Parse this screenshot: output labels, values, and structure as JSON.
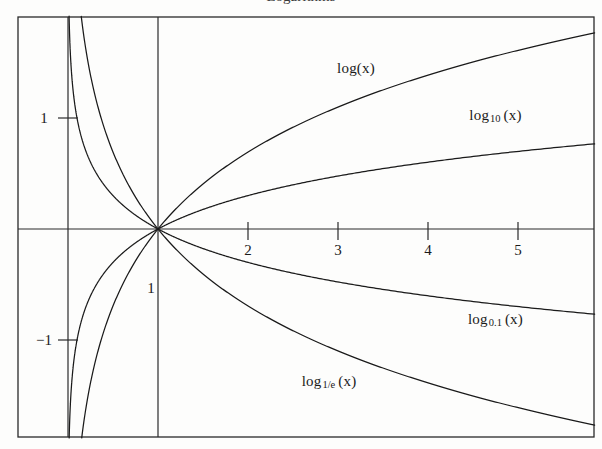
{
  "figure": {
    "width": 602,
    "height": 449,
    "background_color": "#fdfdfc",
    "ink_color": "#1a1a1a",
    "cropped_title_fragment": "Logarithms"
  },
  "chart_data": {
    "type": "line",
    "title": "",
    "xlabel": "",
    "ylabel": "",
    "xlim": [
      -0.57,
      5.97
    ],
    "ylim": [
      -1.87,
      1.91
    ],
    "grid": false,
    "legend_position": "inline-curve-labels",
    "x_ticks": [
      2,
      3,
      4,
      5
    ],
    "x_tick_labels": [
      "2",
      "3",
      "4",
      "5"
    ],
    "y_ticks": [
      1,
      -1
    ],
    "y_tick_labels": [
      "1",
      "-1"
    ],
    "axis_origin_label": "1",
    "series": [
      {
        "name": "log(x)",
        "label": "log(x)",
        "base": 2.718281828,
        "base_display": "",
        "label_x": 3.2,
        "label_y": 1.45,
        "color": "#1a1a1a",
        "x": [
          0.03,
          0.05,
          0.08,
          0.12,
          0.18,
          0.25,
          0.35,
          0.5,
          0.7,
          1.0,
          1.4,
          1.8,
          2.2,
          2.6,
          3.0,
          3.5,
          4.0,
          4.5,
          5.0,
          5.5,
          5.97
        ],
        "y": [
          -3.51,
          -3.0,
          -2.53,
          -2.12,
          -1.71,
          -1.39,
          -1.05,
          -0.69,
          -0.36,
          0.0,
          0.34,
          0.59,
          0.79,
          0.96,
          1.1,
          1.25,
          1.39,
          1.5,
          1.61,
          1.7,
          1.79
        ]
      },
      {
        "name": "log10(x)",
        "label": "log",
        "base": 10,
        "base_display": "10",
        "label_x": 4.75,
        "label_y": 1.02,
        "color": "#1a1a1a",
        "x": [
          0.03,
          0.05,
          0.08,
          0.12,
          0.18,
          0.25,
          0.35,
          0.5,
          0.7,
          1.0,
          1.4,
          1.8,
          2.2,
          2.6,
          3.0,
          3.5,
          4.0,
          4.5,
          5.0,
          5.5,
          5.97
        ],
        "y": [
          -1.52,
          -1.3,
          -1.1,
          -0.92,
          -0.74,
          -0.6,
          -0.46,
          -0.3,
          -0.15,
          0.0,
          0.15,
          0.26,
          0.34,
          0.41,
          0.48,
          0.54,
          0.6,
          0.65,
          0.7,
          0.74,
          0.78
        ]
      },
      {
        "name": "log0.1(x)",
        "label": "log",
        "base": 0.1,
        "base_display": "0.1",
        "label_x": 4.75,
        "label_y": -0.82,
        "color": "#1a1a1a",
        "x": [
          0.03,
          0.05,
          0.08,
          0.12,
          0.18,
          0.25,
          0.35,
          0.5,
          0.7,
          1.0,
          1.4,
          1.8,
          2.2,
          2.6,
          3.0,
          3.5,
          4.0,
          4.5,
          5.0,
          5.5,
          5.97
        ],
        "y": [
          1.52,
          1.3,
          1.1,
          0.92,
          0.74,
          0.6,
          0.46,
          0.3,
          0.15,
          0.0,
          -0.15,
          -0.26,
          -0.34,
          -0.41,
          -0.48,
          -0.54,
          -0.6,
          -0.65,
          -0.7,
          -0.74,
          -0.78
        ]
      },
      {
        "name": "log1/e(x)",
        "label": "log",
        "base": 0.367879441,
        "base_display": "1/e",
        "label_x": 2.9,
        "label_y": -1.38,
        "color": "#1a1a1a",
        "x": [
          0.03,
          0.05,
          0.08,
          0.12,
          0.18,
          0.25,
          0.35,
          0.5,
          0.7,
          1.0,
          1.4,
          1.8,
          2.2,
          2.6,
          3.0,
          3.5,
          4.0,
          4.5,
          5.0,
          5.5,
          5.97
        ],
        "y": [
          3.51,
          3.0,
          2.53,
          2.12,
          1.71,
          1.39,
          1.05,
          0.69,
          0.36,
          0.0,
          -0.34,
          -0.59,
          -0.79,
          -0.96,
          -1.1,
          -1.25,
          -1.39,
          -1.5,
          -1.61,
          -1.7,
          -1.79
        ]
      }
    ]
  }
}
